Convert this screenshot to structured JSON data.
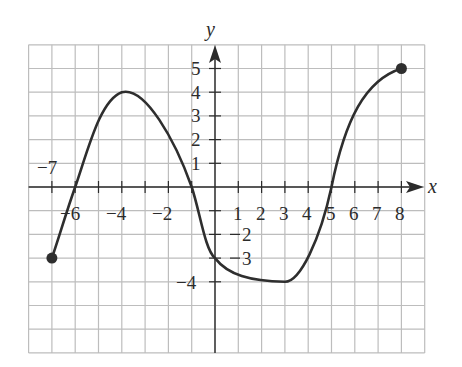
{
  "chart_data": {
    "type": "line",
    "title": "",
    "xlabel": "x",
    "ylabel": "y",
    "xlim": [
      -8,
      9
    ],
    "ylim": [
      -7,
      6
    ],
    "grid": true,
    "grid_step": 1,
    "legend": null,
    "x_tick_labels": [
      "-7",
      "-6",
      "-4",
      "-2",
      "1",
      "2",
      "3",
      "4",
      "5",
      "6",
      "7",
      "8"
    ],
    "y_tick_labels": [
      "5",
      "4",
      "3",
      "2",
      "1",
      "-2",
      "-3",
      "-4"
    ],
    "series": [
      {
        "name": "f(x)",
        "points": [
          {
            "x": -7,
            "y": -3
          },
          {
            "x": -6,
            "y": 0
          },
          {
            "x": -5,
            "y": 2.8
          },
          {
            "x": -4,
            "y": 4
          },
          {
            "x": -3,
            "y": 3.6
          },
          {
            "x": -2,
            "y": 2.2
          },
          {
            "x": -1,
            "y": 0
          },
          {
            "x": 0,
            "y": -3
          },
          {
            "x": 1,
            "y": -3.8
          },
          {
            "x": 2,
            "y": -3.95
          },
          {
            "x": 3,
            "y": -4
          },
          {
            "x": 4,
            "y": -3
          },
          {
            "x": 5,
            "y": 0
          },
          {
            "x": 6,
            "y": 3.3
          },
          {
            "x": 7,
            "y": 4.6
          },
          {
            "x": 8,
            "y": 5
          }
        ],
        "endpoints": [
          {
            "x": -7,
            "y": -3,
            "closed": true
          },
          {
            "x": 8,
            "y": 5,
            "closed": true
          }
        ],
        "key_features": {
          "x_intercepts": [
            -6,
            -1,
            5
          ],
          "y_intercept": -3,
          "local_max": {
            "x": -4,
            "y": 4
          },
          "local_min": {
            "x": 3,
            "y": -4
          }
        }
      }
    ]
  },
  "labels": {
    "x_axis": "x",
    "y_axis": "y",
    "xneg7": "−7",
    "xneg6": "−6",
    "xneg4": "−4",
    "xneg2": "−2",
    "x1": "1",
    "x2": "2",
    "x3": "3",
    "x4": "4",
    "x5": "5",
    "x6": "6",
    "x7": "7",
    "x8": "8",
    "y5": "5",
    "y4": "4",
    "y3": "3",
    "y2": "2",
    "y1": "1",
    "yneg2": "2",
    "yneg3": "3",
    "yneg4": "−4"
  },
  "colors": {
    "grid": "#bdbdbd",
    "axis": "#2b2b2b",
    "curve": "#2e2e2e",
    "background": "#ffffff"
  }
}
